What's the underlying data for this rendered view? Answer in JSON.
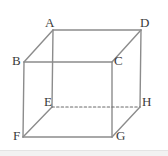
{
  "figure": {
    "background_color": "#ffffff",
    "edge_color": "#8c8c8c",
    "hidden_edge_color": "#6b6b6b",
    "label_color": "#3a3a3a",
    "edge_width": 1.4,
    "canvas": {
      "width": 168,
      "height": 156
    }
  },
  "vertices": [
    {
      "id": "A",
      "label": "A",
      "x": 53,
      "y": 30,
      "label_x": 45,
      "label_y": 16,
      "hidden": false
    },
    {
      "id": "B",
      "label": "B",
      "x": 24,
      "y": 62,
      "label_x": 12,
      "label_y": 54,
      "hidden": false
    },
    {
      "id": "C",
      "label": "C",
      "x": 112,
      "y": 62,
      "label_x": 114,
      "label_y": 54,
      "hidden": false
    },
    {
      "id": "D",
      "label": "D",
      "x": 141,
      "y": 30,
      "label_x": 140,
      "label_y": 16,
      "hidden": false
    },
    {
      "id": "E",
      "label": "E",
      "x": 52,
      "y": 107,
      "label_x": 44,
      "label_y": 95,
      "hidden": true
    },
    {
      "id": "F",
      "label": "F",
      "x": 23,
      "y": 137,
      "label_x": 13,
      "label_y": 129,
      "hidden": false
    },
    {
      "id": "G",
      "label": "G",
      "x": 112,
      "y": 137,
      "label_x": 116,
      "label_y": 129,
      "hidden": false
    },
    {
      "id": "H",
      "label": "H",
      "x": 140,
      "y": 107,
      "label_x": 142,
      "label_y": 95,
      "hidden": false
    }
  ],
  "edges": [
    {
      "from": "A",
      "to": "D",
      "style": "solid"
    },
    {
      "from": "A",
      "to": "B",
      "style": "solid"
    },
    {
      "from": "A",
      "to": "E",
      "style": "solid"
    },
    {
      "from": "D",
      "to": "C",
      "style": "solid"
    },
    {
      "from": "D",
      "to": "H",
      "style": "solid"
    },
    {
      "from": "B",
      "to": "C",
      "style": "solid"
    },
    {
      "from": "B",
      "to": "F",
      "style": "solid"
    },
    {
      "from": "C",
      "to": "G",
      "style": "solid"
    },
    {
      "from": "E",
      "to": "F",
      "style": "solid"
    },
    {
      "from": "E",
      "to": "H",
      "style": "dashed"
    },
    {
      "from": "F",
      "to": "G",
      "style": "solid"
    },
    {
      "from": "G",
      "to": "H",
      "style": "solid"
    }
  ]
}
